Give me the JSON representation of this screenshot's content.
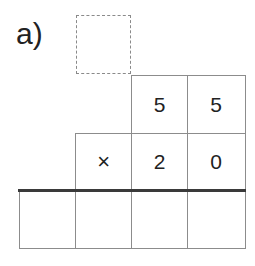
{
  "problem": {
    "label": "a)",
    "carry_box": "",
    "multiplicand": [
      "5",
      "5"
    ],
    "operator": "×",
    "multiplier": [
      "2",
      "0"
    ],
    "result": [
      "",
      "",
      "",
      ""
    ]
  },
  "colors": {
    "grid_line": "#8c8c8c",
    "rule_line": "#3a3a3a",
    "text": "#222222",
    "dashed_border": "#8a8a8a"
  }
}
